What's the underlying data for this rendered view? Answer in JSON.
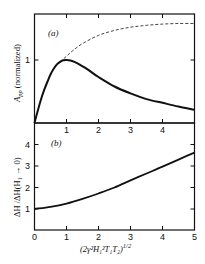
{
  "chart_data": [
    {
      "panel": "a",
      "type": "line",
      "panel_label": "(a)",
      "ylabel": "A_pp (normalized)",
      "ylabel_main": "A",
      "ylabel_sub": "pp",
      "ylabel_rest": " (normalized)",
      "xlabel": "",
      "xlim": [
        0,
        5
      ],
      "ylim": [
        0,
        1.75
      ],
      "x_ticks": [
        1,
        2,
        3,
        4
      ],
      "x_tick_labels": [
        "1",
        "2",
        "3",
        "4"
      ],
      "y_ticks": [
        1
      ],
      "y_tick_labels": [
        "1"
      ],
      "grid": false,
      "series": [
        {
          "name": "A_pp (solid)",
          "style": "solid",
          "x": [
            0,
            0.1,
            0.2,
            0.3,
            0.4,
            0.5,
            0.6,
            0.7,
            0.8,
            0.9,
            1.0,
            1.2,
            1.4,
            1.6,
            1.8,
            2.0,
            2.5,
            3.0,
            3.5,
            4.0,
            4.5,
            5.0
          ],
          "y": [
            0,
            0.19,
            0.37,
            0.52,
            0.65,
            0.77,
            0.86,
            0.93,
            0.97,
            0.995,
            1.0,
            0.98,
            0.93,
            0.87,
            0.8,
            0.73,
            0.58,
            0.47,
            0.38,
            0.32,
            0.26,
            0.21
          ]
        },
        {
          "name": "saturation-free (dashed)",
          "style": "dashed",
          "x": [
            0.8,
            1.0,
            1.2,
            1.5,
            2.0,
            2.5,
            3.0,
            3.5,
            4.0,
            4.5,
            5.0
          ],
          "y": [
            0.97,
            1.06,
            1.15,
            1.26,
            1.39,
            1.47,
            1.52,
            1.55,
            1.57,
            1.58,
            1.58
          ]
        }
      ]
    },
    {
      "panel": "b",
      "type": "line",
      "panel_label": "(b)",
      "ylabel": "ΔH / ΔH(H1 → 0)",
      "xlabel": "(2γ²H1²T1T2)^1/2",
      "xlim": [
        0,
        5
      ],
      "ylim": [
        0,
        5
      ],
      "x_ticks": [
        0,
        1,
        2,
        3,
        4,
        5
      ],
      "x_tick_labels": [
        "0",
        "1",
        "2",
        "3",
        "4",
        "5"
      ],
      "y_ticks": [
        1,
        2,
        3,
        4
      ],
      "y_tick_labels": [
        "1",
        "2",
        "3",
        "4"
      ],
      "grid": false,
      "series": [
        {
          "name": "linewidth ratio",
          "style": "solid",
          "x": [
            0,
            0.5,
            1.0,
            1.5,
            2.0,
            2.5,
            3.0,
            3.5,
            4.0,
            4.5,
            5.0
          ],
          "y": [
            1.0,
            1.1,
            1.25,
            1.47,
            1.72,
            2.0,
            2.33,
            2.65,
            2.97,
            3.3,
            3.62
          ]
        }
      ]
    }
  ],
  "labels": {
    "panel_a": "(a)",
    "panel_b": "(b)",
    "ylabel_a_main": "A",
    "ylabel_a_sub": "pp",
    "ylabel_a_rest": " (normalized)",
    "ylabel_b": "ΔH /ΔH(H₁ → 0)",
    "xlabel_main": "(2γ²H₁²T₁T₂)",
    "xlabel_exp": "1/2"
  }
}
